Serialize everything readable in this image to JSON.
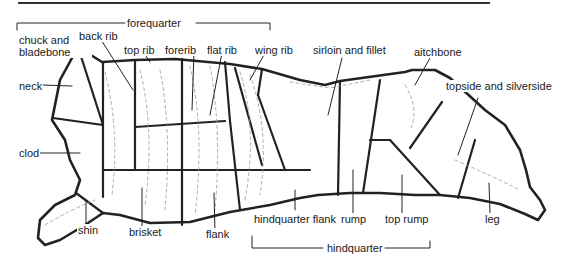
{
  "diagram": {
    "groups": {
      "forequarter": "forequarter",
      "hindquarter": "hindquarter"
    },
    "cuts": {
      "chuck_and_bladebone": "chuck and bladebone",
      "back_rib": "back rib",
      "top_rib": "top rib",
      "forerib": "forerib",
      "flat_rib": "flat rib",
      "wing_rib": "wing rib",
      "sirloin_and_fillet": "sirloin and fillet",
      "aitchbone": "aitchbone",
      "topside_and_silverside": "topside and silverside",
      "neck": "neck",
      "clod": "clod",
      "shin": "shin",
      "brisket": "brisket",
      "flank": "flank",
      "hindquarter_flank": "hindquarter flank",
      "rump": "rump",
      "top_rump": "top rump",
      "leg": "leg"
    }
  }
}
